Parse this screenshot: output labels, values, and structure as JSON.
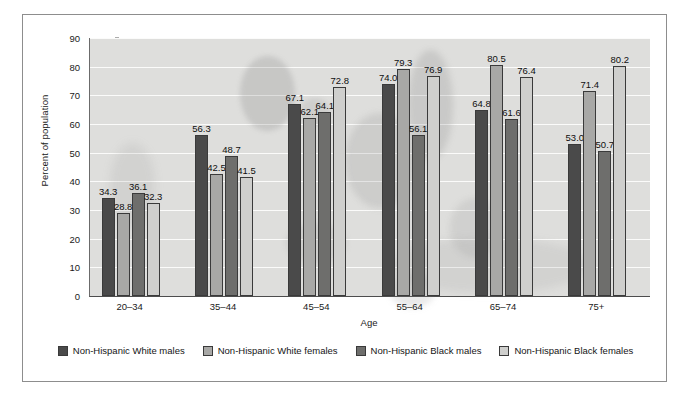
{
  "chart_data": {
    "type": "bar",
    "title": "",
    "xlabel": "Age",
    "ylabel": "Percent of population",
    "ylim": [
      0,
      90
    ],
    "yticks": [
      0,
      10,
      20,
      30,
      40,
      50,
      60,
      70,
      80,
      90
    ],
    "grid": true,
    "legend_position": "bottom",
    "categories": [
      "20–34",
      "35–44",
      "45–54",
      "55–64",
      "65–74",
      "75+"
    ],
    "series": [
      {
        "name": "Non-Hispanic White males",
        "color": "#4a4a4a",
        "values": [
          34.3,
          56.3,
          67.1,
          74.0,
          64.8,
          53.0
        ],
        "labels": [
          "34.3",
          "56.3",
          "67.1",
          "74.0",
          "64.8",
          "53.0"
        ]
      },
      {
        "name": "Non-Hispanic White females",
        "color": "#a8a8a6",
        "values": [
          28.8,
          42.5,
          62.1,
          79.3,
          80.5,
          71.4
        ],
        "labels": [
          "28.8",
          "42.5",
          "62.1",
          "79.3",
          "80.5",
          "71.4"
        ]
      },
      {
        "name": "Non-Hispanic Black males",
        "color": "#6e6e6c",
        "values": [
          36.1,
          48.7,
          64.1,
          56.1,
          61.6,
          50.7
        ],
        "labels": [
          "36.1",
          "48.7",
          "64.1",
          "56.1",
          "61.6",
          "50.7"
        ]
      },
      {
        "name": "Non-Hispanic Black females",
        "color": "#cfcfcd",
        "values": [
          32.3,
          41.5,
          72.8,
          76.9,
          76.4,
          80.2
        ],
        "labels": [
          "32.3",
          "41.5",
          "72.8",
          "76.9",
          "76.4",
          "80.2"
        ]
      }
    ],
    "plot_background": "#dededc",
    "gridline_color": "#fbfbfa"
  },
  "figure": {
    "border_color": "#8d8d8d",
    "background": "#ffffff"
  }
}
